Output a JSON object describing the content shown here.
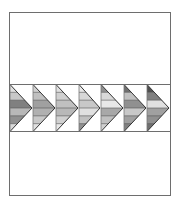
{
  "diagram": {
    "type": "quilt-block",
    "canvas": {
      "width": 179,
      "height": 204,
      "background": "#ffffff"
    },
    "frame": {
      "x": 9,
      "y": 12,
      "width": 161,
      "height": 183,
      "stroke": "#6e6e6e",
      "stroke_width": 1
    },
    "band": {
      "y_top": 84,
      "y_bottom": 131,
      "stroke": "#6e6e6e",
      "stroke_width": 1
    },
    "arrow_outline": "#333333",
    "arrows": [
      {
        "base_x": 10,
        "tip_x": 32,
        "clipped_left": true,
        "stripes": [
          "#e0e0e0",
          "#c8c8c8",
          "#808080",
          "#b8b8b8",
          "#909090",
          "#d8d8d8"
        ]
      },
      {
        "base_x": 33,
        "tip_x": 55,
        "stripes": [
          "#d0d0d0",
          "#c0c0c0",
          "#a0a0a0",
          "#b0b0b0",
          "#c8c8c8",
          "#e0e0e0"
        ]
      },
      {
        "base_x": 56,
        "tip_x": 78,
        "stripes": [
          "#e0e0e0",
          "#d0d0d0",
          "#c0c0c0",
          "#b8b8b8",
          "#d0d0d0",
          "#e8e8e8"
        ]
      },
      {
        "base_x": 79,
        "tip_x": 100,
        "stripes": [
          "#e8e8e8",
          "#d8d8d8",
          "#c8c8c8",
          "#e0e0e0",
          "#c0c0c0",
          "#909090"
        ]
      },
      {
        "base_x": 101,
        "tip_x": 123,
        "stripes": [
          "#909090",
          "#d8d8d8",
          "#e8e8e8",
          "#a8a8a8",
          "#c0c0c0",
          "#d0d0d0"
        ]
      },
      {
        "base_x": 124,
        "tip_x": 146,
        "stripes": [
          "#707070",
          "#c0c0c0",
          "#909090",
          "#c8c8c8",
          "#a0a0a0",
          "#808080"
        ]
      },
      {
        "base_x": 147,
        "tip_x": 169,
        "stripes": [
          "#505050",
          "#808080",
          "#e0e0e0",
          "#a0a0a0",
          "#909090",
          "#707070"
        ]
      }
    ]
  }
}
